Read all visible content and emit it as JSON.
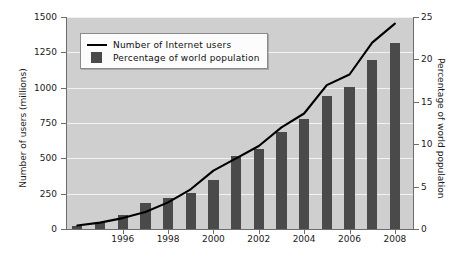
{
  "chart_data": {
    "type": "bar",
    "title": "",
    "subtitle": "",
    "xlabel": "",
    "ylabel": "Number of users (millions)",
    "y2label": "Percentage of world population",
    "grid": true,
    "legend_position": "upper left",
    "x": [
      1994,
      1995,
      1996,
      1997,
      1998,
      1999,
      2000,
      2001,
      2002,
      2003,
      2004,
      2005,
      2006,
      2007,
      2008
    ],
    "xtick_labels": [
      "1996",
      "1998",
      "2000",
      "2002",
      "2004",
      "2006",
      "2008"
    ],
    "xtick_values": [
      1996,
      1998,
      2000,
      2002,
      2004,
      2006,
      2008
    ],
    "xlim": [
      1993.5,
      2008.8
    ],
    "ylim": [
      0,
      1500
    ],
    "ytick_values": [
      0,
      250,
      500,
      750,
      1000,
      1250,
      1500
    ],
    "ytick_labels": [
      "0",
      "250",
      "500",
      "750",
      "1000",
      "1250",
      "1500"
    ],
    "y2lim": [
      0,
      25
    ],
    "y2tick_values": [
      0,
      5,
      10,
      15,
      20,
      25
    ],
    "y2tick_labels": [
      "0",
      "5",
      "10",
      "15",
      "20",
      "25"
    ],
    "series": [
      {
        "name": "Percentage of world population",
        "type": "bar",
        "axis": "right",
        "unit": "%",
        "color": "#4a4a4a",
        "values": [
          0.4,
          0.8,
          1.7,
          3.1,
          3.7,
          4.2,
          5.8,
          8.6,
          9.4,
          11.5,
          13.0,
          15.7,
          16.7,
          19.9,
          21.9
        ]
      },
      {
        "name": "Number of Internet users",
        "type": "line",
        "axis": "left",
        "unit": "millions",
        "color": "#000000",
        "values": [
          25,
          45,
          77,
          120,
          188,
          281,
          413,
          500,
          587,
          719,
          817,
          1018,
          1093,
          1319,
          1453
        ]
      }
    ],
    "legend": [
      {
        "label": "Number of Internet users",
        "marker": "line",
        "color": "#000000"
      },
      {
        "label": "Percentage of world population",
        "marker": "square",
        "color": "#4a4a4a"
      }
    ],
    "colors": {
      "plot_background": "#cfcfcf",
      "gridline": "#f2f2f2",
      "bar": "#4a4a4a",
      "line": "#000000",
      "axis": "#6d6d6d",
      "text": "#1a1a1a",
      "figure_background": "#ffffff"
    }
  }
}
